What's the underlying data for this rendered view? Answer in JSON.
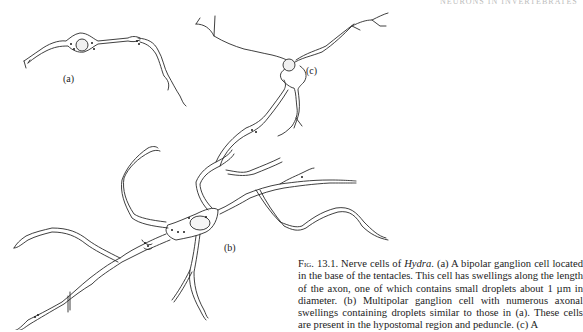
{
  "running_header": {
    "text": "NEURONS IN INVERTEBRATES"
  },
  "figure": {
    "labels": {
      "a": "(a)",
      "b": "(b)",
      "c": "(c)"
    },
    "caption": {
      "prefix": "Fig.",
      "number": "13.1.",
      "title_pre": " Nerve cells of ",
      "genus": "Hydra",
      "body": ". (a) A bipolar ganglion cell located in the base of the tentacles. This cell has swellings along the length of the axon, one of which contains small droplets about 1 µm in diameter. (b) Multipolar ganglion cell with numerous axonal swellings containing droplets similar to those in (a). These cells are present in the hypostomal region and peduncle. (c) A"
    }
  }
}
